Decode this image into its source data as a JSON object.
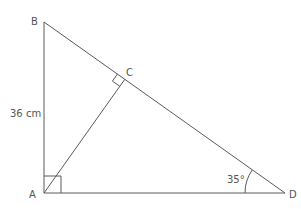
{
  "diagram": {
    "type": "geometry",
    "points": {
      "A": {
        "label": "A",
        "x": 44,
        "y": 193
      },
      "B": {
        "label": "B",
        "x": 44,
        "y": 22
      },
      "C": {
        "label": "C",
        "x": 125,
        "y": 79
      },
      "D": {
        "label": "D",
        "x": 285,
        "y": 193
      }
    },
    "segments": [
      "AB",
      "BD",
      "AD",
      "AC"
    ],
    "right_angles": [
      "A",
      "C"
    ],
    "annotations": {
      "side_AB": "36 cm",
      "angle_D": "35°"
    },
    "colors": {
      "line": "#5a5a5a",
      "text": "#555555",
      "background": "#ffffff"
    }
  }
}
